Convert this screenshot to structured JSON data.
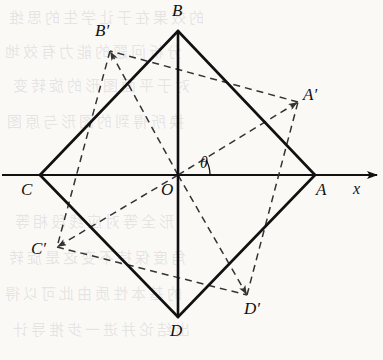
{
  "figure": {
    "width": 383,
    "height": 360,
    "background_color": "#faf9f6",
    "ink_color": "#111111"
  },
  "axis": {
    "x_label": "x",
    "x_label_pos": {
      "x": 353,
      "y": 180
    },
    "line": {
      "x1": 2,
      "y1": 175,
      "x2": 377,
      "y2": 175
    },
    "arrow_tip": {
      "x": 377,
      "y": 175
    }
  },
  "angle": {
    "symbol": "θ",
    "label_pos": {
      "x": 200,
      "y": 154
    },
    "value_deg": 28,
    "arc_radius": 32,
    "from_deg": 0,
    "to_deg": 28
  },
  "origin": {
    "name": "O",
    "label": "O",
    "x": 178,
    "y": 175,
    "label_pos": {
      "x": 161,
      "y": 181
    }
  },
  "square_solid": {
    "name": "ABCD",
    "stroke": "#111111",
    "stroke_width": 2.6,
    "style": "solid",
    "vertices": [
      {
        "label": "A",
        "x": 315,
        "y": 175,
        "label_pos": {
          "x": 316,
          "y": 181
        }
      },
      {
        "label": "B",
        "x": 178,
        "y": 31,
        "label_pos": {
          "x": 172,
          "y": 2
        }
      },
      {
        "label": "C",
        "x": 40,
        "y": 175,
        "label_pos": {
          "x": 21,
          "y": 181
        }
      },
      {
        "label": "D",
        "x": 178,
        "y": 317,
        "label_pos": {
          "x": 170,
          "y": 322
        }
      }
    ],
    "diagonals": [
      {
        "from": "C",
        "to": "A",
        "style": "solid-on-axis"
      },
      {
        "from": "B",
        "to": "D",
        "style": "solid"
      }
    ]
  },
  "square_dashed": {
    "name": "A'B'C'D'",
    "stroke": "#333333",
    "stroke_width": 1.5,
    "style": "dashed",
    "dash_pattern": "7,5",
    "vertices": [
      {
        "label": "A′",
        "x": 298,
        "y": 102,
        "label_pos": {
          "x": 303,
          "y": 86
        }
      },
      {
        "label": "B′",
        "x": 110,
        "y": 51,
        "label_pos": {
          "x": 95,
          "y": 22
        }
      },
      {
        "label": "C′",
        "x": 57,
        "y": 247,
        "label_pos": {
          "x": 31,
          "y": 240
        }
      },
      {
        "label": "D′",
        "x": 247,
        "y": 295,
        "label_pos": {
          "x": 244,
          "y": 300
        }
      }
    ],
    "rays_from_origin": [
      {
        "to": "A′",
        "arrowhead": true
      },
      {
        "to": "B′",
        "arrowhead": true
      },
      {
        "to": "C′",
        "arrowhead": true
      },
      {
        "to": "D′",
        "arrowhead": true
      }
    ]
  },
  "background_watermark": {
    "visible": true,
    "description": "faint reversed CJK text bleeding through the page",
    "lines": [
      {
        "text": "的效果在于让学生的思维",
        "x": 6,
        "y": 6
      },
      {
        "text": "分析问题的能力有效地",
        "x": 2,
        "y": 40
      },
      {
        "text": "对于平面图形的旋转变",
        "x": 10,
        "y": 74
      },
      {
        "text": "换所得到的图形与原图",
        "x": 4,
        "y": 110
      },
      {
        "text": "形全等对应线段相等",
        "x": 12,
        "y": 210
      },
      {
        "text": "角度保持不变这是旋转",
        "x": 6,
        "y": 246
      },
      {
        "text": "的基本性质由此可以得",
        "x": 2,
        "y": 282
      },
      {
        "text": "出结论并进一步推导计",
        "x": 10,
        "y": 318
      }
    ]
  }
}
